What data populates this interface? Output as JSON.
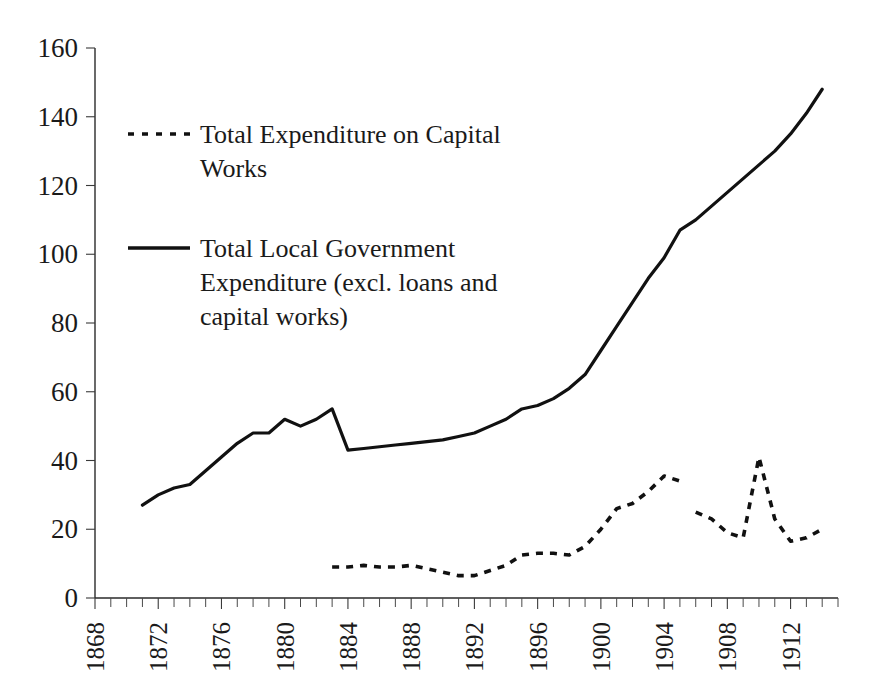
{
  "chart_data": {
    "type": "line",
    "title": "",
    "subtitle": "",
    "xlabel": "",
    "ylabel": "",
    "xlim": [
      1868,
      1915
    ],
    "ylim": [
      0,
      160
    ],
    "yticks": [
      0,
      20,
      40,
      60,
      80,
      100,
      120,
      140,
      160
    ],
    "xticks": [
      1868,
      1872,
      1876,
      1880,
      1884,
      1888,
      1892,
      1896,
      1900,
      1904,
      1908,
      1912
    ],
    "xtick_minor_step": 1,
    "grid": false,
    "legend_position": "upper-left-inside",
    "series": [
      {
        "name": "Total Expenditure on Capital Works",
        "style": "dotted",
        "color": "#111111",
        "x": [
          1883,
          1884,
          1885,
          1886,
          1887,
          1888,
          1889,
          1890,
          1891,
          1892,
          1893,
          1894,
          1895,
          1896,
          1897,
          1898,
          1899,
          1900,
          1901,
          1902,
          1903,
          1904,
          1905
        ],
        "values": [
          9,
          9,
          9.5,
          9,
          9,
          9.5,
          8.5,
          7.5,
          6.5,
          6.5,
          8,
          9.5,
          12.5,
          13,
          13,
          12.5,
          15,
          20,
          26,
          27.5,
          31,
          35.5,
          34
        ]
      },
      {
        "name": "Total Expenditure on Capital Works (continued)",
        "style": "dotted",
        "color": "#111111",
        "x": [
          1906,
          1907,
          1908,
          1909,
          1910,
          1911,
          1912,
          1913,
          1914
        ],
        "values": [
          25,
          23,
          19,
          17.5,
          41,
          23,
          16.5,
          17.5,
          20
        ]
      },
      {
        "name": "Total Local Government Expenditure (excl. loans and capital works)",
        "style": "solid",
        "color": "#111111",
        "x": [
          1871,
          1872,
          1873,
          1874,
          1875,
          1876,
          1877,
          1878,
          1879,
          1880,
          1881,
          1882,
          1883,
          1884,
          1885,
          1886,
          1887,
          1888,
          1889,
          1890,
          1891,
          1892,
          1893,
          1894,
          1895,
          1896,
          1897,
          1898,
          1899,
          1900,
          1901,
          1902,
          1903,
          1904,
          1905,
          1906,
          1907,
          1908,
          1909,
          1910,
          1911,
          1912,
          1913,
          1914
        ],
        "values": [
          27,
          30,
          32,
          33,
          37,
          41,
          45,
          48,
          48,
          52,
          50,
          52,
          55,
          43,
          43.5,
          44,
          44.5,
          45,
          45.5,
          46,
          47,
          48,
          50,
          52,
          55,
          56,
          58,
          61,
          65,
          72,
          79,
          86,
          93,
          99,
          107,
          110,
          114,
          118,
          122,
          126,
          130,
          135,
          141,
          148
        ]
      }
    ]
  },
  "legend": {
    "entries": [
      {
        "style": "dotted",
        "lines": [
          "Total Expenditure on Capital",
          "Works"
        ]
      },
      {
        "style": "solid",
        "lines": [
          "Total Local Government",
          "Expenditure (excl. loans and",
          "capital works)"
        ]
      }
    ]
  },
  "axes": {
    "y_tick_labels": [
      "160",
      "140",
      "120",
      "100",
      "80",
      "60",
      "40",
      "20",
      "0"
    ],
    "x_tick_labels": [
      "1868",
      "1872",
      "1876",
      "1880",
      "1884",
      "1888",
      "1892",
      "1896",
      "1900",
      "1904",
      "1908",
      "1912"
    ]
  },
  "colors": {
    "line": "#111111",
    "axis": "#2a2a2a",
    "text": "#1a1a1a",
    "background": "#ffffff"
  }
}
